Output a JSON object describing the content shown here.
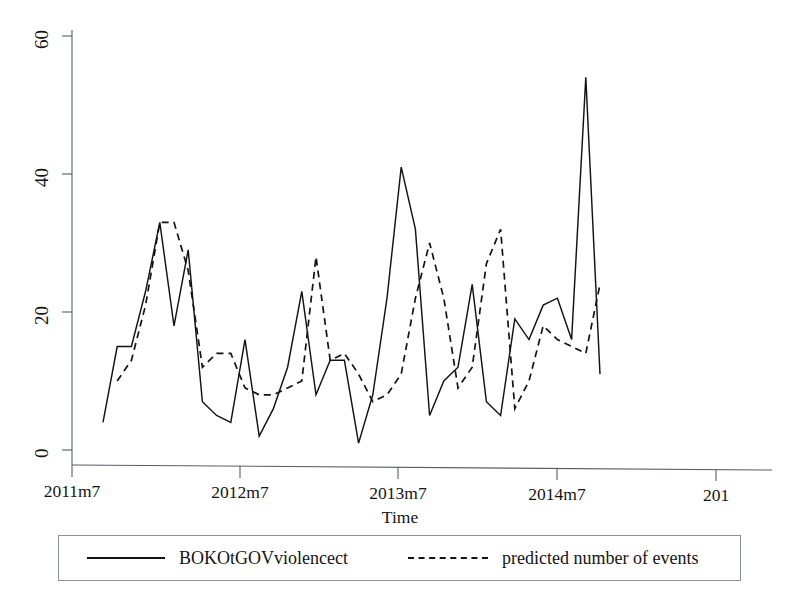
{
  "chart_data": {
    "type": "line",
    "title": "",
    "xlabel": "Time",
    "ylabel": "",
    "ylim": [
      0,
      63
    ],
    "yticks": [
      0,
      20,
      40,
      60
    ],
    "ytick_labels": [
      "0",
      "20",
      "40",
      "60"
    ],
    "xtick_labels": [
      "2011m7",
      "2012m7",
      "2013m7",
      "2014m7",
      "201"
    ],
    "xtick_values": [
      "2011m7",
      "2012m7",
      "2013m7",
      "2014m7",
      "2015m7"
    ],
    "grid": false,
    "legend_position": "below-axis",
    "x": [
      "2011m8",
      "2011m9",
      "2011m10",
      "2011m11",
      "2011m12",
      "2012m1",
      "2012m2",
      "2012m3",
      "2012m4",
      "2012m5",
      "2012m6",
      "2012m7",
      "2012m8",
      "2012m9",
      "2012m10",
      "2012m11",
      "2012m12",
      "2013m1",
      "2013m2",
      "2013m3",
      "2013m4",
      "2013m5",
      "2013m6",
      "2013m7",
      "2013m8",
      "2013m9",
      "2013m10",
      "2013m11",
      "2013m12",
      "2014m1",
      "2014m2",
      "2014m3",
      "2014m4",
      "2014m5",
      "2014m6",
      "2014m7"
    ],
    "series": [
      {
        "name": "BOKOtGOVviolencect",
        "style": "solid",
        "color": "#131313",
        "values": [
          4,
          15,
          15,
          23,
          33,
          18,
          29,
          7,
          5,
          4,
          16,
          2,
          6,
          12,
          23,
          8,
          13,
          13,
          1,
          8,
          22,
          41,
          32,
          5,
          10,
          12,
          24,
          7,
          5,
          19,
          16,
          21,
          22,
          16,
          54,
          11
        ]
      },
      {
        "name": "predicted number of events",
        "style": "dashed",
        "color": "#131313",
        "values": [
          null,
          10,
          13,
          21,
          33,
          33,
          26,
          12,
          14,
          14,
          9,
          8,
          8,
          9,
          10,
          28,
          13,
          14,
          11,
          7,
          8,
          11,
          22,
          30,
          22,
          9,
          12,
          27,
          32,
          6,
          10,
          18,
          16,
          15,
          14,
          24
        ]
      }
    ]
  },
  "axes": {
    "x_title": "Time",
    "y_tick_0": "0",
    "y_tick_20": "20",
    "y_tick_40": "40",
    "y_tick_60": "60",
    "x_tick_1": "2011m7",
    "x_tick_2": "2012m7",
    "x_tick_3": "2013m7",
    "x_tick_4": "2014m7",
    "x_tick_5": "201"
  },
  "legend": {
    "entries": [
      {
        "label": "BOKOtGOVviolencect",
        "style": "solid"
      },
      {
        "label": "predicted number of events",
        "style": "dashed"
      }
    ]
  }
}
